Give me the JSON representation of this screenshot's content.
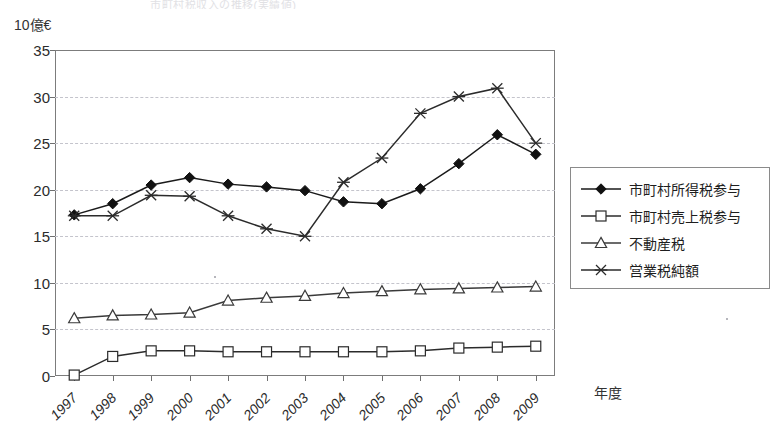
{
  "title_faint": "市町村税収入の推移(実績値)",
  "y_axis_unit": "10億€",
  "x_axis_title": "年度",
  "legend": {
    "items": [
      {
        "label": "市町村所得税参与",
        "marker": "filled-diamond",
        "color": "#1a1a1a"
      },
      {
        "label": "市町村売上税参与",
        "marker": "open-square",
        "color": "#2b2b2b"
      },
      {
        "label": "不動産税",
        "marker": "open-triangle",
        "color": "#3a3a3a"
      },
      {
        "label": "営業税純額",
        "marker": "cross-star",
        "color": "#2b2b2b"
      }
    ]
  },
  "chart_data": {
    "type": "line",
    "title": "市町村税収入の推移(実績値)",
    "xlabel": "年度",
    "ylabel": "10億€",
    "ylim": [
      0,
      35
    ],
    "yticks": [
      0,
      5,
      10,
      15,
      20,
      25,
      30,
      35
    ],
    "grid": true,
    "legend_position": "right",
    "categories": [
      "1997",
      "1998",
      "1999",
      "2000",
      "2001",
      "2002",
      "2003",
      "2004",
      "2005",
      "2006",
      "2007",
      "2008",
      "2009"
    ],
    "series": [
      {
        "name": "市町村所得税参与",
        "marker": "filled-diamond",
        "values": [
          17.3,
          18.5,
          20.5,
          21.3,
          20.6,
          20.3,
          19.9,
          18.7,
          18.5,
          20.1,
          22.8,
          25.9,
          23.8
        ]
      },
      {
        "name": "市町村売上税参与",
        "marker": "open-square",
        "values": [
          0.1,
          2.1,
          2.7,
          2.7,
          2.6,
          2.6,
          2.6,
          2.6,
          2.6,
          2.7,
          3.0,
          3.1,
          3.2
        ]
      },
      {
        "name": "不動産税",
        "marker": "open-triangle",
        "values": [
          6.2,
          6.5,
          6.6,
          6.8,
          8.1,
          8.4,
          8.6,
          8.9,
          9.1,
          9.3,
          9.4,
          9.5,
          9.6
        ]
      },
      {
        "name": "営業税純額",
        "marker": "cross-star",
        "values": [
          17.2,
          17.2,
          19.4,
          19.3,
          17.2,
          15.8,
          15.0,
          20.8,
          23.4,
          28.2,
          30.0,
          30.9,
          25.0
        ]
      }
    ]
  }
}
